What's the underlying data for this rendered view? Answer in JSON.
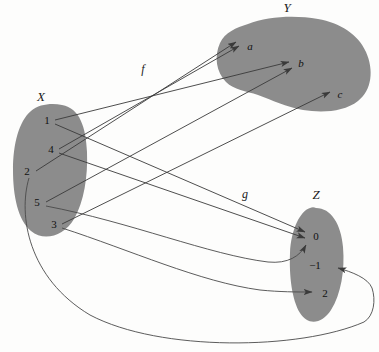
{
  "diagram": {
    "colors": {
      "blob_fill": "#8c8c8c",
      "arrow": "#3a3a3a",
      "background": "#fdfdfc",
      "text": "#111111"
    },
    "sets": [
      {
        "id": "X",
        "label": "X",
        "label_pos": [
          41,
          101
        ],
        "elements": [
          {
            "id": "x1",
            "label": "1",
            "x": 47,
            "y": 121
          },
          {
            "id": "x4",
            "label": "4",
            "x": 51,
            "y": 150
          },
          {
            "id": "x2",
            "label": "2",
            "x": 27,
            "y": 172
          },
          {
            "id": "x5",
            "label": "5",
            "x": 37,
            "y": 203
          },
          {
            "id": "x3",
            "label": "3",
            "x": 54,
            "y": 225
          }
        ]
      },
      {
        "id": "Y",
        "label": "Y",
        "label_pos": [
          287,
          12
        ],
        "elements": [
          {
            "id": "ya",
            "label": "a",
            "x": 250,
            "y": 47
          },
          {
            "id": "yb",
            "label": "b",
            "x": 301,
            "y": 64
          },
          {
            "id": "yc",
            "label": "c",
            "x": 340,
            "y": 95
          }
        ]
      },
      {
        "id": "Z",
        "label": "Z",
        "label_pos": [
          316,
          199
        ],
        "elements": [
          {
            "id": "z0",
            "label": "0",
            "x": 316,
            "y": 237
          },
          {
            "id": "zm1",
            "label": "−1",
            "x": 315,
            "y": 266
          },
          {
            "id": "z2",
            "label": "2",
            "x": 325,
            "y": 294
          }
        ]
      }
    ],
    "functions": [
      {
        "id": "f",
        "label": "f",
        "label_pos": [
          143,
          73
        ]
      },
      {
        "id": "g",
        "label": "g",
        "label_pos": [
          245,
          198
        ]
      }
    ],
    "mappings": [
      {
        "from": "1",
        "to": "b",
        "function": "f"
      },
      {
        "from": "4",
        "to": "a",
        "function": "f"
      },
      {
        "from": "2",
        "to": "a",
        "function": "f"
      },
      {
        "from": "5",
        "to": "b",
        "function": "f"
      },
      {
        "from": "3",
        "to": "c",
        "function": "f"
      },
      {
        "from": "1",
        "to": "0",
        "function": "g"
      },
      {
        "from": "4",
        "to": "0",
        "function": "g"
      },
      {
        "from": "5",
        "to": "0",
        "function": "g"
      },
      {
        "from": "3",
        "to": "2",
        "function": "g"
      },
      {
        "from": "2",
        "to": "−1",
        "function": "g"
      }
    ]
  }
}
